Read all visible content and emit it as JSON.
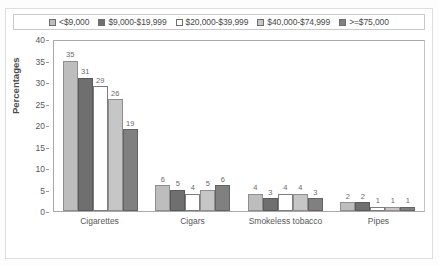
{
  "chart_data": {
    "type": "bar",
    "title": "",
    "xlabel": "",
    "ylabel": "Percentages",
    "ylim": [
      0,
      40
    ],
    "ytick_step": 5,
    "yticks": [
      0,
      5,
      10,
      15,
      20,
      25,
      30,
      35,
      40
    ],
    "grid": false,
    "legend_position": "top",
    "categories": [
      "Cigarettes",
      "Cigars",
      "Smokeless tobacco",
      "Pipes"
    ],
    "series": [
      {
        "name": "<$9,000",
        "values": [
          35,
          6,
          4,
          2
        ],
        "color": "#bdbdbd"
      },
      {
        "name": "$9,000-$19,999",
        "values": [
          31,
          5,
          3,
          2
        ],
        "color": "#6f6f6f"
      },
      {
        "name": "$20,000-$39,999",
        "values": [
          29,
          4,
          4,
          1
        ],
        "color": "#ffffff"
      },
      {
        "name": "$40,000-$74,999",
        "values": [
          26,
          5,
          4,
          1
        ],
        "color": "#c6c6c6"
      },
      {
        "name": ">=$75,000",
        "values": [
          19,
          6,
          3,
          1
        ],
        "color": "#808080"
      }
    ]
  }
}
